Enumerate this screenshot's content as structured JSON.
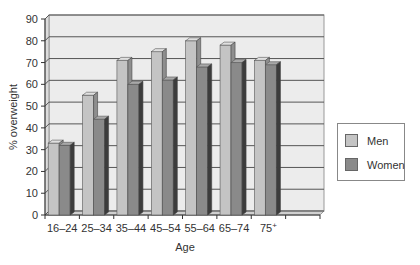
{
  "chart_data": {
    "type": "bar",
    "title": "",
    "xlabel": "Age",
    "ylabel": "% overweight",
    "ylim": [
      0,
      90
    ],
    "yticks": [
      0,
      10,
      20,
      30,
      40,
      50,
      60,
      70,
      80,
      90
    ],
    "grid": true,
    "legend_position": "right",
    "categories": [
      "16–24",
      "25–34",
      "35–44",
      "45–54",
      "55–64",
      "65–74",
      "75+"
    ],
    "series": [
      {
        "name": "Men",
        "color": "#c4c4c4",
        "values": [
          33,
          55,
          71,
          75,
          80,
          78,
          71
        ]
      },
      {
        "name": "Women",
        "color": "#8a8a8a",
        "values": [
          32,
          44,
          60,
          62,
          68,
          70,
          69
        ]
      }
    ]
  },
  "legend": {
    "men_label": "Men",
    "women_label": "Women"
  },
  "axes": {
    "xlabel": "Age",
    "ylabel": "% overweight"
  }
}
